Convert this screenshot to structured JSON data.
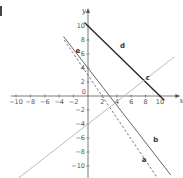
{
  "chart_data": {
    "type": "line",
    "title": "",
    "xlabel": "x",
    "ylabel": "y",
    "xlim": [
      -11,
      12
    ],
    "ylim": [
      -12,
      12
    ],
    "grid": false,
    "x_ticks": [
      -10,
      -8,
      -6,
      -4,
      -2,
      2,
      4,
      6,
      8,
      10
    ],
    "y_ticks": [
      -10,
      -8,
      -6,
      -4,
      -2,
      2,
      4,
      6,
      8,
      10
    ],
    "origin_label": "0",
    "series": [
      {
        "name": "d",
        "style": "solid",
        "color": "#222222",
        "equation": "y = 10 - x",
        "points": [
          [
            -0.5,
            10.5
          ],
          [
            10.6,
            -0.6
          ]
        ]
      },
      {
        "name": "b",
        "style": "solid",
        "color": "#666666",
        "equation": "y = 4 - 4x/3",
        "points": [
          [
            -3.4,
            8.5
          ],
          [
            11.5,
            -11.3
          ]
        ]
      },
      {
        "name": "a",
        "style": "dashed",
        "color": "#777777",
        "equation": "y = 3 - 1.5x",
        "points": [
          [
            -3.3,
            8.0
          ],
          [
            9.5,
            -11.5
          ]
        ]
      },
      {
        "name": "c",
        "style": "solid",
        "color": "#bbbbbb",
        "equation": "y = 0.8x - 4",
        "points": [
          [
            -10,
            -12
          ],
          [
            12,
            5.6
          ]
        ]
      }
    ],
    "annotations": [
      {
        "text": "d",
        "x": 4.8,
        "y": 6.8
      },
      {
        "text": "c",
        "x": 8.3,
        "y": 2.3
      },
      {
        "text": "b",
        "x": 9.4,
        "y": -6.5
      },
      {
        "text": "a",
        "x": 7.8,
        "y": -9.4
      },
      {
        "text": "e",
        "x": -1.4,
        "y": 6.2
      }
    ]
  }
}
